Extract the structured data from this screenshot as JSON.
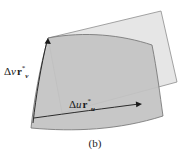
{
  "figure": {
    "caption": "(b)",
    "labels": {
      "dv_delta": "Δ",
      "dv_var": "v",
      "dv_vec": "r",
      "dv_star": "*",
      "dv_sub": "v",
      "du_delta": "Δ",
      "du_var": "u",
      "du_vec": "r",
      "du_star": "*",
      "du_sub": "u"
    },
    "colors": {
      "tangent_plane_fill": "#e3e3e3",
      "tangent_plane_stroke": "#8a8a8a",
      "surface_patch_fill": "#c2c2c2",
      "surface_patch_stroke": "#6b6b6b",
      "arrow": "#1a1a1a",
      "text": "#1a1a1a",
      "background": "#ffffff"
    },
    "shapes": {
      "tangent_plane_name": "tangent-plane-parallelogram",
      "surface_patch_name": "curved-surface-patch",
      "arrow_v_name": "delta-v-vector-arrow",
      "arrow_u_name": "delta-u-vector-arrow"
    }
  }
}
